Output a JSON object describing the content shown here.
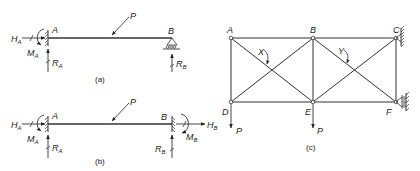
{
  "diagram_a": {
    "caption": "(a)",
    "labels": {
      "left_end": "A",
      "right_end": "B",
      "load": "P",
      "left_horizontal_reaction": "H",
      "left_horizontal_reaction_sub": "A",
      "left_moment": "M",
      "left_moment_sub": "A",
      "left_vertical_reaction": "R",
      "left_vertical_reaction_sub": "A",
      "right_vertical_reaction": "R",
      "right_vertical_reaction_sub": "B"
    },
    "supports": {
      "left": "fixed",
      "right": "roller"
    }
  },
  "diagram_b": {
    "caption": "(b)",
    "labels": {
      "left_end": "A",
      "right_end": "B",
      "load": "P",
      "left_horizontal_reaction": "H",
      "left_horizontal_reaction_sub": "A",
      "left_moment": "M",
      "left_moment_sub": "A",
      "left_vertical_reaction": "R",
      "left_vertical_reaction_sub": "A",
      "right_horizontal_reaction": "H",
      "right_horizontal_reaction_sub": "B",
      "right_moment": "M",
      "right_moment_sub": "B",
      "right_vertical_reaction": "R",
      "right_vertical_reaction_sub": "B"
    },
    "supports": {
      "left": "fixed",
      "right": "fixed"
    }
  },
  "diagram_c": {
    "caption": "(c)",
    "nodes": {
      "A": "A",
      "B": "B",
      "C": "C",
      "D": "D",
      "E": "E",
      "F": "F"
    },
    "angle_labels": {
      "x": "X",
      "y": "Y"
    },
    "loads": {
      "at_D": "P",
      "at_E": "P"
    },
    "supports": {
      "C": "fixed wall",
      "F": "roller"
    }
  }
}
